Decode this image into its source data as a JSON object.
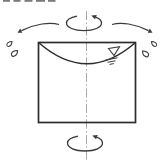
{
  "canvas": {
    "width": 165,
    "height": 164
  },
  "colors": {
    "background": "#ffffff",
    "ink": "#3a3a3a",
    "outline": "#2d2d2d",
    "centerline": "#a8a8a8",
    "fragment": "#5a5a5a"
  },
  "diagram": {
    "kind": "rotating-container-with-liquid-line-drawing",
    "components": [
      {
        "name": "cropped-text-fragments",
        "icon": "cut-off-text-bottom-edges"
      },
      {
        "name": "rotation-axis-centerline",
        "icon": "dash-dot-vertical-axis"
      },
      {
        "name": "rotation-arrow-top",
        "icon": "curved-rotation-arrow"
      },
      {
        "name": "rotation-arrow-bottom",
        "icon": "curved-rotation-arrow"
      },
      {
        "name": "fling-arrow-left",
        "icon": "outward-curved-arrow"
      },
      {
        "name": "fling-arrow-right",
        "icon": "outward-curved-arrow"
      },
      {
        "name": "droplets-left",
        "icon": "two-splash-droplets"
      },
      {
        "name": "droplets-right",
        "icon": "two-splash-droplets"
      },
      {
        "name": "container-tank",
        "icon": "rectangle-outline"
      },
      {
        "name": "liquid-surface-curve",
        "icon": "concave-parabolic-surface"
      },
      {
        "name": "free-surface-symbol",
        "icon": "inverted-triangle-with-hatches"
      }
    ]
  }
}
